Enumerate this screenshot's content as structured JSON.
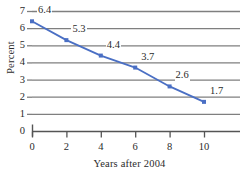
{
  "chart_data": {
    "type": "line",
    "title": "",
    "subtitle": "",
    "xlabel": "Years after 2004",
    "ylabel": "Percent",
    "x": [
      0,
      2,
      4,
      6,
      8,
      10
    ],
    "values": [
      6.4,
      5.3,
      4.4,
      3.7,
      2.6,
      1.7
    ],
    "point_labels": [
      "6.4",
      "5.3",
      "4.4",
      "3.7",
      "2.6",
      "1.7"
    ],
    "xticks": [
      "0",
      "2",
      "4",
      "6",
      "8",
      "10"
    ],
    "yticks": [
      "0",
      "1",
      "2",
      "3",
      "4",
      "5",
      "6",
      "7"
    ],
    "xlim": [
      0,
      10
    ],
    "ylim": [
      0,
      7
    ],
    "grid": "horizontal",
    "legend": "none",
    "series": [
      {
        "name": "Percent",
        "x": [
          0,
          2,
          4,
          6,
          8,
          10
        ],
        "values": [
          6.4,
          5.3,
          4.4,
          3.7,
          2.6,
          1.7
        ],
        "line_color": "#4a6fc4",
        "marker_color": "#4a6fc4",
        "marker": "square"
      }
    ],
    "colors": {
      "line": "#4a6fc4",
      "marker": "#4a6fc4",
      "grid": "#7f7f7f",
      "axis": "#555555",
      "text": "#2b2b2b",
      "background": "#ffffff"
    }
  }
}
